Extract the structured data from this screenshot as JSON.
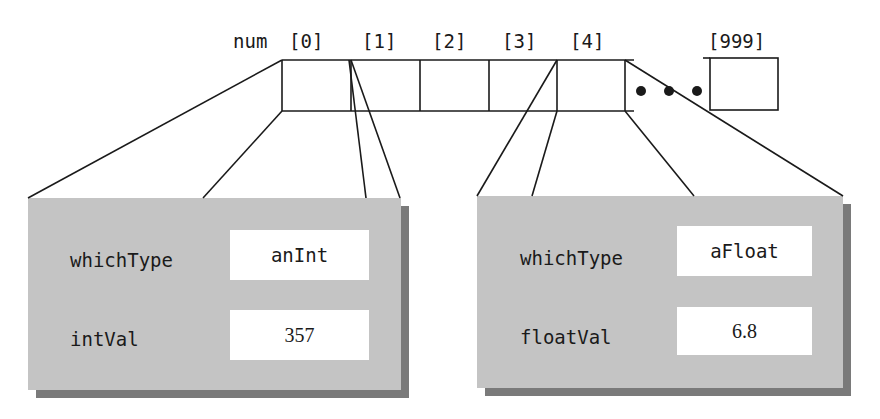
{
  "array": {
    "name": "num",
    "indices": [
      "[0]",
      "[1]",
      "[2]",
      "[3]",
      "[4]"
    ],
    "last_index": "[999]",
    "ellipsis": "• • •"
  },
  "structs": [
    {
      "element": "[0]",
      "fields": [
        {
          "label": "whichType",
          "value": "anInt"
        },
        {
          "label": "intVal",
          "value": "357"
        }
      ]
    },
    {
      "element": "[4]",
      "fields": [
        {
          "label": "whichType",
          "value": "aFloat"
        },
        {
          "label": "floatVal",
          "value": "6.8"
        }
      ]
    }
  ],
  "colors": {
    "struct_fill": "#c4c4c4",
    "struct_shadow": "#7a7a7a",
    "line": "#1a1a1a"
  }
}
